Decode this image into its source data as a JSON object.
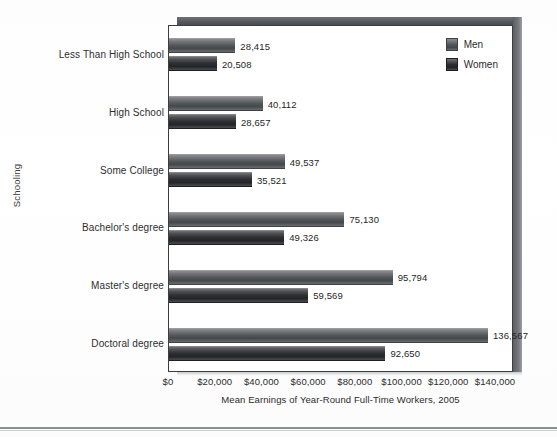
{
  "chart_data": {
    "type": "bar",
    "orientation": "horizontal",
    "title": "",
    "xlabel": "Mean Earnings of Year-Round Full-Time Workers, 2005",
    "ylabel": "Schooling",
    "xlim": [
      0,
      140000
    ],
    "xtick_values": [
      0,
      20000,
      40000,
      60000,
      80000,
      100000,
      120000,
      140000
    ],
    "xtick_labels": [
      "$0",
      "$20,000",
      "$40,000",
      "$60,000",
      "$80,000",
      "$100,000",
      "$120,000",
      "$140,000"
    ],
    "grid": false,
    "legend_position": "top-right-inside",
    "categories": [
      "Less Than High School",
      "High School",
      "Some College",
      "Bachelor's degree",
      "Master's degree",
      "Doctoral degree"
    ],
    "series": [
      {
        "name": "Men",
        "color": "#55585b",
        "values": [
          28415,
          40112,
          49537,
          75130,
          95794,
          136567
        ],
        "labels": [
          "28,415",
          "40,112",
          "49,537",
          "75,130",
          "95,794",
          "136,567"
        ]
      },
      {
        "name": "Women",
        "color": "#2c2e31",
        "values": [
          20508,
          28657,
          35521,
          49326,
          59569,
          92650
        ],
        "labels": [
          "20,508",
          "28,657",
          "35,521",
          "49,326",
          "59,569",
          "92,650"
        ]
      }
    ]
  },
  "legend": {
    "items": [
      {
        "label": "Men",
        "key": "men"
      },
      {
        "label": "Women",
        "key": "women"
      }
    ]
  },
  "colors": {
    "frame": "#3b3d40",
    "slab": "#53565a",
    "men_bar": "#55585b",
    "women_bar": "#2c2e31",
    "text": "#2b2b2b",
    "page_rule": "#8d8f93"
  }
}
